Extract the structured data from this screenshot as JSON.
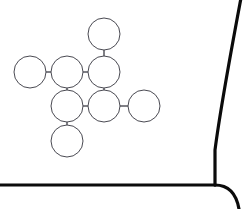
{
  "canvas": {
    "width": 247,
    "height": 209,
    "background_color": "#ffffff"
  },
  "frame": {
    "name": "panel-border",
    "stroke_color": "#0b0b0b",
    "stroke_width": 3.2,
    "right_edge_curve": "M 241 -2 C 232 46, 221 104, 215 150 L 215 185",
    "bottom_edge": "M -2 185 L 215 185",
    "corner_curve": "M 215 185 C 228 185, 236 192, 239 209"
  },
  "graph": {
    "name": "node-link-diagram",
    "node_radius": 16,
    "node_fill": "#ffffff",
    "node_stroke": "#4a4a52",
    "edge_stroke": "#4a4a52",
    "nodes": [
      {
        "id": "n1",
        "label": "",
        "cx": 104,
        "cy": 34
      },
      {
        "id": "n2",
        "label": "",
        "cx": 30,
        "cy": 72
      },
      {
        "id": "n3",
        "label": "",
        "cx": 67,
        "cy": 72
      },
      {
        "id": "n4",
        "label": "",
        "cx": 104,
        "cy": 72
      },
      {
        "id": "n5",
        "label": "",
        "cx": 67,
        "cy": 106
      },
      {
        "id": "n6",
        "label": "",
        "cx": 104,
        "cy": 106
      },
      {
        "id": "n7",
        "label": "",
        "cx": 144,
        "cy": 106
      },
      {
        "id": "n8",
        "label": "",
        "cx": 67,
        "cy": 141
      }
    ],
    "edges": [
      {
        "id": "e1",
        "from": "n1",
        "to": "n4",
        "x1": 104,
        "y1": 50,
        "x2": 104,
        "y2": 56
      },
      {
        "id": "e2",
        "from": "n2",
        "to": "n3",
        "x1": 46,
        "y1": 72,
        "x2": 51,
        "y2": 72
      },
      {
        "id": "e3",
        "from": "n3",
        "to": "n4",
        "x1": 83,
        "y1": 72,
        "x2": 88,
        "y2": 72
      },
      {
        "id": "e4",
        "from": "n3",
        "to": "n5",
        "x1": 67,
        "y1": 88,
        "x2": 67,
        "y2": 90
      },
      {
        "id": "e5",
        "from": "n4",
        "to": "n6",
        "x1": 104,
        "y1": 88,
        "x2": 104,
        "y2": 90
      },
      {
        "id": "e6",
        "from": "n5",
        "to": "n6",
        "x1": 83,
        "y1": 106,
        "x2": 88,
        "y2": 106
      },
      {
        "id": "e7",
        "from": "n6",
        "to": "n7",
        "x1": 120,
        "y1": 106,
        "x2": 128,
        "y2": 106
      },
      {
        "id": "e8",
        "from": "n5",
        "to": "n8",
        "x1": 67,
        "y1": 122,
        "x2": 67,
        "y2": 125
      }
    ]
  }
}
